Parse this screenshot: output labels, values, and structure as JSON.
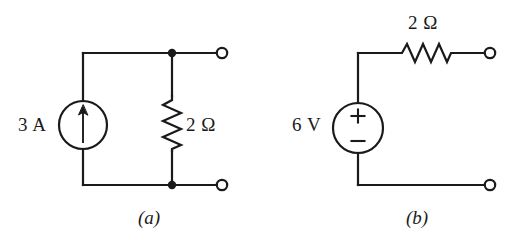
{
  "figure": {
    "background_color": "#ffffff",
    "line_color": "#1a1a1a",
    "width": 521,
    "height": 249
  },
  "circuit_a": {
    "subfigure_label": "(a)",
    "source": {
      "type": "current-source",
      "label": "3 A",
      "value": 3,
      "unit": "A",
      "arrow_direction": "up"
    },
    "resistor": {
      "type": "resistor-vertical",
      "label": "2 Ω",
      "value": 2,
      "unit": "Ω",
      "orientation": "vertical"
    },
    "terminals": [
      "top-right-terminal",
      "bottom-right-terminal"
    ],
    "nodes": [
      "top-node-dot",
      "bottom-node-dot"
    ]
  },
  "circuit_b": {
    "subfigure_label": "(b)",
    "source": {
      "type": "voltage-source",
      "label": "6 V",
      "value": 6,
      "unit": "V",
      "plus_sign": "+",
      "minus_sign": "−",
      "polarity": "plus-on-top"
    },
    "resistor": {
      "type": "resistor-horizontal",
      "label": "2 Ω",
      "value": 2,
      "unit": "Ω",
      "orientation": "horizontal"
    },
    "terminals": [
      "top-right-terminal",
      "bottom-right-terminal"
    ],
    "nodes": []
  }
}
